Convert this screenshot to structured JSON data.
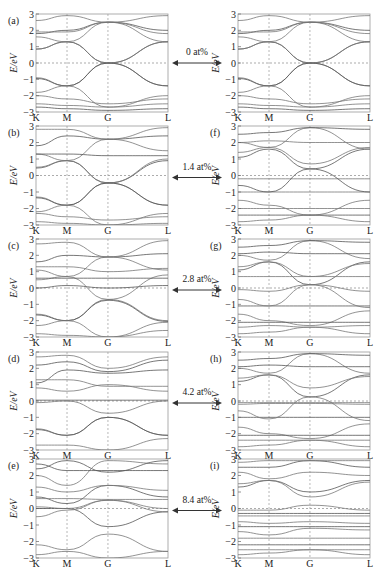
{
  "chart_data": {
    "type": "line",
    "xlabel": "",
    "ylabel": "E/eV",
    "ylim": [
      -3,
      3
    ],
    "yticks": [
      "3",
      "2",
      "1",
      "0",
      "-1",
      "-2",
      "-3"
    ],
    "kpoints": [
      "K",
      "M",
      "G",
      "L"
    ],
    "fermi_level": 0,
    "grid": "dashed verticals at high-symmetry points and dashed line at E=0",
    "concentrations": [
      {
        "label": "0 at%",
        "left_panel": "(a)",
        "right_panel": ""
      },
      {
        "label": "1.4 at%",
        "left_panel": "(b)",
        "right_panel": "(f)"
      },
      {
        "label": "2.8 at%",
        "left_panel": "(c)",
        "right_panel": "(g)"
      },
      {
        "label": "4.2 at%",
        "left_panel": "(d)",
        "right_panel": "(h)"
      },
      {
        "label": "8.4 at%",
        "left_panel": "(e)",
        "right_panel": "(i)"
      }
    ],
    "panels": [
      {
        "id": "a",
        "label": "(a)",
        "bands": [
          [
            0.85,
            1.3,
            0,
            1.3
          ],
          [
            0.85,
            1.3,
            0,
            1.3
          ],
          [
            1.6,
            1.3,
            2.5,
            1.3
          ],
          [
            1.8,
            2.0,
            2.5,
            2.0
          ],
          [
            2.6,
            2.9,
            2.5,
            2.9
          ],
          [
            -0.9,
            -1.4,
            0,
            -1.4
          ],
          [
            -0.95,
            -1.4,
            0,
            -1.4
          ],
          [
            -1.8,
            -1.4,
            -2.7,
            -2.0
          ],
          [
            -2.5,
            -2.6,
            -2.7,
            -2.5
          ],
          [
            -2.7,
            -2.8,
            -2.9,
            -2.8
          ],
          [
            1.9,
            1.9,
            2.5,
            1.8
          ],
          [
            -2.0,
            -2.2,
            -2.5,
            -2.2
          ]
        ]
      },
      {
        "id": "b",
        "label": "(b)",
        "bands": [
          [
            0.45,
            0.9,
            -0.45,
            0.9
          ],
          [
            0.5,
            0.9,
            -0.45,
            1.0
          ],
          [
            1.3,
            0.9,
            2.2,
            1.5
          ],
          [
            1.8,
            2.4,
            2.2,
            2.4
          ],
          [
            2.8,
            2.8,
            2.2,
            2.9
          ],
          [
            -1.3,
            -1.8,
            -0.45,
            -1.8
          ],
          [
            -1.35,
            -1.8,
            -0.45,
            -1.8
          ],
          [
            -2.2,
            -1.8,
            -3.0,
            -2.3
          ],
          [
            -2.8,
            -2.9,
            -3.0,
            -2.9
          ],
          [
            1.3,
            1.3,
            1.2,
            1.2
          ],
          [
            -2.3,
            -2.5,
            -2.7,
            -2.5
          ]
        ]
      },
      {
        "id": "c",
        "label": "(c)",
        "bands": [
          [
            0.0,
            0.15,
            0.0,
            0.15
          ],
          [
            0.5,
            0.7,
            -0.7,
            0.8
          ],
          [
            1.1,
            0.7,
            1.9,
            1.1
          ],
          [
            1.6,
            2.0,
            1.9,
            2.1
          ],
          [
            2.7,
            2.8,
            1.9,
            2.9
          ],
          [
            -1.6,
            -2.0,
            -0.7,
            -2.0
          ],
          [
            -1.65,
            -2.0,
            -0.75,
            -2.05
          ],
          [
            -2.3,
            -2.0,
            -3.0,
            -2.1
          ],
          [
            -2.8,
            -2.9,
            -3.0,
            -2.6
          ],
          [
            0.6,
            0.6,
            0.6,
            0.6
          ],
          [
            1.3,
            1.3,
            1.0,
            1.2
          ]
        ]
      },
      {
        "id": "d",
        "label": "(d)",
        "bands": [
          [
            0.05,
            0.05,
            0.05,
            0.05
          ],
          [
            -0.1,
            0.0,
            -0.75,
            0.0
          ],
          [
            0.8,
            0.6,
            1.0,
            0.6
          ],
          [
            1.1,
            1.9,
            1.7,
            1.9
          ],
          [
            2.7,
            2.8,
            2.0,
            2.7
          ],
          [
            -1.7,
            -2.1,
            -1.0,
            -2.1
          ],
          [
            -1.75,
            -2.1,
            -1.0,
            -2.1
          ],
          [
            -2.7,
            -2.7,
            -3.0,
            -2.3
          ],
          [
            1.3,
            1.3,
            0.9,
            0.9
          ],
          [
            2.2,
            2.4,
            1.8,
            2.5
          ]
        ]
      },
      {
        "id": "e",
        "label": "(e)",
        "bands": [
          [
            0.0,
            0.0,
            -1.1,
            -0.2
          ],
          [
            0.1,
            0.0,
            0.5,
            0.0
          ],
          [
            -0.5,
            -0.1,
            0.5,
            -0.2
          ],
          [
            0.7,
            0.3,
            1.4,
            0.7
          ],
          [
            1.3,
            1.0,
            1.4,
            1.1
          ],
          [
            2.0,
            1.4,
            2.9,
            2.7
          ],
          [
            2.4,
            2.9,
            2.2,
            2.9
          ],
          [
            -2.2,
            -2.5,
            -1.55,
            -2.6
          ],
          [
            -2.8,
            -2.6,
            -3.0,
            -2.6
          ],
          [
            2.7,
            2.3,
            2.3,
            2.3
          ],
          [
            0.6,
            0.6,
            0.55,
            0.55
          ]
        ]
      },
      {
        "id": "f",
        "label": "(f)",
        "bands": [
          [
            1.1,
            1.6,
            0.4,
            1.6
          ],
          [
            1.4,
            1.7,
            0.7,
            1.7
          ],
          [
            2.0,
            1.7,
            2.9,
            1.6
          ],
          [
            2.5,
            2.6,
            2.9,
            2.8
          ],
          [
            -0.2,
            -0.2,
            -0.2,
            -0.2
          ],
          [
            -1.0,
            -1.0,
            -1.0,
            -1.0
          ],
          [
            -0.6,
            -1.0,
            0.4,
            -1.0
          ],
          [
            -1.5,
            -1.8,
            -2.4,
            -1.5
          ],
          [
            -2.0,
            -2.0,
            -2.0,
            -2.0
          ],
          [
            -2.4,
            -2.4,
            -2.4,
            -2.4
          ],
          [
            -2.8,
            -2.7,
            -2.4,
            -2.8
          ],
          [
            2.0,
            2.1,
            2.0,
            2.0
          ]
        ]
      },
      {
        "id": "g",
        "label": "(g)",
        "bands": [
          [
            1.1,
            1.6,
            0.2,
            1.6
          ],
          [
            1.3,
            1.6,
            0.7,
            1.5
          ],
          [
            2.0,
            1.7,
            2.9,
            1.8
          ],
          [
            2.5,
            2.6,
            2.9,
            2.8
          ],
          [
            0.7,
            0.7,
            0.7,
            0.7
          ],
          [
            -0.1,
            -0.2,
            0.2,
            -0.2
          ],
          [
            -1.1,
            -1.1,
            -1.1,
            -1.1
          ],
          [
            -0.7,
            -1.1,
            0.2,
            -1.2
          ],
          [
            -1.6,
            -2.0,
            -2.3,
            -1.4
          ],
          [
            -2.1,
            -2.1,
            -2.1,
            -2.1
          ],
          [
            -2.4,
            -2.3,
            -2.4,
            -2.3
          ],
          [
            -2.8,
            -2.7,
            -2.4,
            -2.8
          ],
          [
            2.1,
            2.2,
            2.1,
            2.1
          ]
        ]
      },
      {
        "id": "h",
        "label": "(h)",
        "bands": [
          [
            1.2,
            1.6,
            0.25,
            1.6
          ],
          [
            1.4,
            1.6,
            0.8,
            1.5
          ],
          [
            2.0,
            1.7,
            2.9,
            1.7
          ],
          [
            2.5,
            2.6,
            2.9,
            2.8
          ],
          [
            -0.1,
            -0.1,
            -0.1,
            -0.1
          ],
          [
            -0.2,
            -0.15,
            -0.15,
            -0.2
          ],
          [
            -1.0,
            -1.0,
            -1.0,
            -1.0
          ],
          [
            -0.6,
            -1.1,
            0.25,
            -1.2
          ],
          [
            -1.6,
            -2.0,
            -2.3,
            -1.4
          ],
          [
            -2.1,
            -2.1,
            -2.1,
            -2.1
          ],
          [
            -2.4,
            -2.4,
            -2.4,
            -2.4
          ],
          [
            -2.8,
            -2.7,
            -2.4,
            -2.8
          ],
          [
            2.1,
            2.2,
            2.1,
            2.1
          ]
        ]
      },
      {
        "id": "i",
        "label": "(i)",
        "bands": [
          [
            1.3,
            1.7,
            1.0,
            1.7
          ],
          [
            1.5,
            1.7,
            0.7,
            1.6
          ],
          [
            2.2,
            1.8,
            2.2,
            2.0
          ],
          [
            2.5,
            2.5,
            2.9,
            2.5
          ],
          [
            2.8,
            2.9,
            2.9,
            2.9
          ],
          [
            -0.1,
            -0.1,
            0.2,
            -0.1
          ],
          [
            -0.3,
            -0.3,
            -0.3,
            -0.3
          ],
          [
            -0.45,
            -0.45,
            -0.45,
            -0.45
          ],
          [
            -0.8,
            -0.9,
            -0.8,
            -0.9
          ],
          [
            -1.1,
            -1.1,
            -1.1,
            -1.1
          ],
          [
            -1.4,
            -1.6,
            -1.2,
            -1.3
          ],
          [
            -1.8,
            -1.8,
            -1.8,
            -1.8
          ],
          [
            -2.2,
            -2.2,
            -2.2,
            -2.2
          ],
          [
            -2.5,
            -2.5,
            -2.5,
            -2.5
          ],
          [
            -2.8,
            -2.7,
            -2.5,
            -2.8
          ]
        ]
      }
    ]
  }
}
